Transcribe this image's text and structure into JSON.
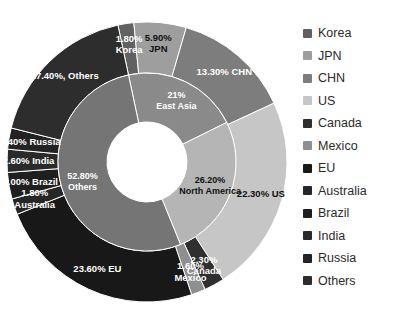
{
  "chart_data": {
    "type": "pie",
    "title": "",
    "subtitle": "",
    "xlabel": "",
    "ylabel": "",
    "legend_position": "right",
    "grid": false,
    "rings": [
      {
        "name": "inner",
        "categories": [
          "East Asia",
          "North America",
          "Others"
        ],
        "values": [
          21.0,
          26.2,
          52.8
        ],
        "labels": [
          "21%",
          "26.20%",
          "52.80%"
        ],
        "label_names": [
          "East Asia",
          "North America",
          "Others"
        ],
        "colors": [
          "#8a8a8a",
          "#b5b5b5",
          "#757575"
        ]
      },
      {
        "name": "outer",
        "categories": [
          "Korea",
          "JPN",
          "CHN",
          "US",
          "Canada",
          "Mexico",
          "EU",
          "Australia",
          "Brazil",
          "India",
          "Russia",
          "Others"
        ],
        "values": [
          1.8,
          5.9,
          13.3,
          22.3,
          2.3,
          1.6,
          23.6,
          1.8,
          3.0,
          2.6,
          2.4,
          17.4
        ],
        "labels": [
          "1.80%",
          "5.90%",
          "13.30% CHN",
          "22.30% US",
          "2.30%",
          "1.60%",
          "23.60% EU",
          "1.80%",
          "3.00% Brazil",
          "2.60% India",
          "2.40% Russia",
          "17.40%, Others"
        ],
        "label2": [
          "Korea",
          "JPN",
          "",
          "",
          "Canada",
          "Mexico",
          "",
          "Australia",
          "",
          "",
          "",
          ""
        ],
        "colors": [
          "#616161",
          "#9e9e9e",
          "#7d7d7d",
          "#c6c6c6",
          "#2f2f2f",
          "#8f8f8f",
          "#181818",
          "#262626",
          "#1f1f1f",
          "#2a2a2a",
          "#232323",
          "#2d2d2d"
        ]
      }
    ]
  },
  "legend": {
    "items": [
      {
        "label": "Korea",
        "color": "#616161"
      },
      {
        "label": "JPN",
        "color": "#9e9e9e"
      },
      {
        "label": "CHN",
        "color": "#7d7d7d"
      },
      {
        "label": "US",
        "color": "#c6c6c6"
      },
      {
        "label": "Canada",
        "color": "#2f2f2f"
      },
      {
        "label": "Mexico",
        "color": "#8f8f8f"
      },
      {
        "label": "EU",
        "color": "#181818"
      },
      {
        "label": "Australia",
        "color": "#262626"
      },
      {
        "label": "Brazil",
        "color": "#1f1f1f"
      },
      {
        "label": "India",
        "color": "#2a2a2a"
      },
      {
        "label": "Russia",
        "color": "#232323"
      },
      {
        "label": "Others",
        "color": "#2d2d2d"
      }
    ]
  },
  "geometry": {
    "cx": 147,
    "cy": 162,
    "r_outer": 140,
    "r_mid": 89,
    "r_inner": 40,
    "start_angle_deg": -12
  }
}
